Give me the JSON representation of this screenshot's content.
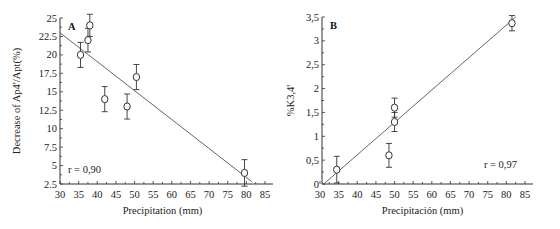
{
  "chart_data": [
    {
      "type": "scatter",
      "panel_label": "A",
      "title": "",
      "xlabel": "Precipitation (mm)",
      "ylabel": "Decrease of Ap4'/Apt(%)",
      "xlim": [
        30,
        85
      ],
      "ylim": [
        2.5,
        25
      ],
      "xticks": [
        30,
        35,
        40,
        45,
        50,
        55,
        60,
        65,
        70,
        75,
        80,
        85
      ],
      "yticks": [
        2.5,
        5,
        7.5,
        10,
        12.5,
        15,
        17.5,
        20,
        22.5,
        25
      ],
      "ytick_labels": [
        "2.5",
        "5",
        "7.5",
        "10",
        "12.5",
        "15",
        "17.5",
        "20",
        "22.5",
        "25"
      ],
      "grid": false,
      "points": [
        {
          "x": 35.5,
          "y": 20,
          "err": 1.7
        },
        {
          "x": 37.5,
          "y": 22,
          "err": 1.6
        },
        {
          "x": 38,
          "y": 24,
          "err": 1.5
        },
        {
          "x": 42,
          "y": 14,
          "err": 1.7
        },
        {
          "x": 48,
          "y": 13,
          "err": 1.7
        },
        {
          "x": 50.5,
          "y": 17,
          "err": 1.7
        },
        {
          "x": 79.5,
          "y": 4,
          "err": 1.8
        }
      ],
      "fit_line": {
        "x1": 30,
        "y1": 23,
        "x2": 81.5,
        "y2": 2.8
      },
      "annotation": "r = 0,90",
      "annotation_pos": "bottom-left"
    },
    {
      "type": "scatter",
      "panel_label": "B",
      "title": "",
      "xlabel": "Precipitación (mm)",
      "ylabel": "%K3,4'",
      "xlim": [
        30,
        85
      ],
      "ylim": [
        0,
        3.5
      ],
      "xticks": [
        30,
        35,
        40,
        45,
        50,
        55,
        60,
        65,
        70,
        75,
        80,
        85
      ],
      "yticks": [
        0,
        0.5,
        1,
        1.5,
        2,
        2.5,
        3,
        3.5
      ],
      "ytick_labels": [
        "0",
        "0,5",
        "1",
        "1,5",
        "2",
        "2,5",
        "3",
        "3,5"
      ],
      "grid": false,
      "points": [
        {
          "x": 34.5,
          "y": 0.3,
          "err": 0.28
        },
        {
          "x": 48.5,
          "y": 0.6,
          "err": 0.25
        },
        {
          "x": 50,
          "y": 1.6,
          "err": 0.2
        },
        {
          "x": 50,
          "y": 1.3,
          "err": 0.2
        },
        {
          "x": 81.5,
          "y": 3.37,
          "err": 0.16
        }
      ],
      "fit_line": {
        "x1": 31,
        "y1": 0,
        "x2": 82.5,
        "y2": 3.5
      },
      "annotation": "r = 0,97",
      "annotation_pos": "bottom-right"
    }
  ]
}
